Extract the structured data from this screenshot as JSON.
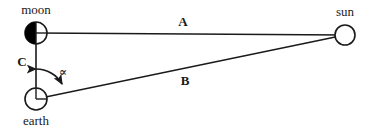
{
  "diagram": {
    "stroke_color": "#1a1a1a",
    "fill_color": "#000000",
    "background_color": "#ffffff",
    "bodies": {
      "moon": {
        "label": "moon",
        "symbol": "half-filled-circle",
        "cx": 36,
        "cy": 33,
        "r": 11,
        "label_x": 36,
        "label_y": 14
      },
      "sun": {
        "label": "sun",
        "symbol": "open-circle",
        "cx": 345,
        "cy": 35,
        "r": 10,
        "label_x": 345,
        "label_y": 16
      },
      "earth": {
        "label": "earth",
        "symbol": "crossed-circle",
        "cx": 36,
        "cy": 99,
        "r": 11,
        "label_x": 36,
        "label_y": 125
      }
    },
    "segments": {
      "A": {
        "label": "A",
        "from": "moon",
        "to": "sun",
        "x1": 36,
        "y1": 33,
        "x2": 345,
        "y2": 35,
        "label_x": 183,
        "label_y": 26
      },
      "B": {
        "label": "B",
        "from": "earth",
        "to": "sun",
        "x1": 36,
        "y1": 99,
        "x2": 345,
        "y2": 35,
        "label_x": 185,
        "label_y": 85
      },
      "C": {
        "label": "C",
        "from": "moon",
        "to": "earth",
        "x1": 36,
        "y1": 33,
        "x2": 36,
        "y2": 99,
        "label_x": 22,
        "label_y": 66
      }
    },
    "angle": {
      "label": "∝",
      "vertex": "earth",
      "between": [
        "C",
        "B"
      ],
      "label_x": 63,
      "label_y": 76,
      "arc_radius": 30
    }
  }
}
